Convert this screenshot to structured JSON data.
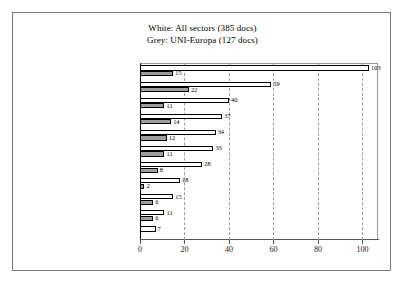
{
  "top_caption": "",
  "legend": {
    "line1": "White: All sectors  (385 docs)",
    "line2": "Grey: UNI-Europa  (127 docs)"
  },
  "chart_data": {
    "type": "bar",
    "orientation": "horizontal",
    "title": "",
    "xlabel": "",
    "ylabel": "",
    "xlim": [
      0,
      107
    ],
    "xticks": [
      "0",
      "20",
      "40",
      "60",
      "80",
      "100"
    ],
    "xtick_values": [
      0,
      20,
      40,
      60,
      80,
      100
    ],
    "grid": true,
    "grid_axis": "x",
    "legend_position": "top-center",
    "categories": [
      "Economic and/or sectoral pol.",
      "Social dialogue",
      "Training",
      "Working conditions",
      "Employment",
      "Health and safety",
      "Soc. aspects of Community pol.",
      "Working time",
      "Enlargement",
      "Non-discrimination",
      "Sustainable development"
    ],
    "series": [
      {
        "name": "White: All sectors  (385 docs)",
        "color": "#ffffff",
        "values": [
          103,
          59,
          40,
          37,
          34,
          33,
          28,
          18,
          15,
          11,
          7
        ]
      },
      {
        "name": "Grey: UNI-Europa  (127 docs)",
        "color": "#9e9e9e",
        "values": [
          15,
          22,
          11,
          14,
          12,
          11,
          8,
          2,
          6,
          6,
          null
        ]
      }
    ]
  }
}
